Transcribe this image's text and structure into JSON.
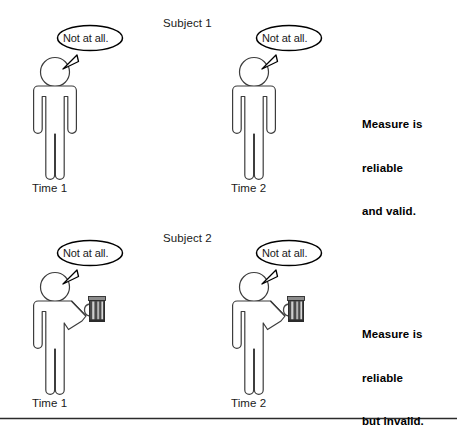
{
  "page": {
    "width": 457,
    "height": 426,
    "background_color": "#ffffff",
    "line_color": "#3d3d3d",
    "text_color": "#1a1a1a",
    "footer_rule": true
  },
  "panels": [
    {
      "id": "subject-1",
      "title": "Subject 1",
      "verdict": [
        "Measure is",
        "reliable",
        "and valid."
      ],
      "figures": [
        {
          "id": "s1-t1",
          "time_label": "Time 1",
          "bubble_text": "Not at all.",
          "holds_mug": false
        },
        {
          "id": "s1-t2",
          "time_label": "Time 2",
          "bubble_text": "Not at all.",
          "holds_mug": false
        }
      ]
    },
    {
      "id": "subject-2",
      "title": "Subject 2",
      "verdict": [
        "Measure is",
        "reliable",
        "but invalid."
      ],
      "figures": [
        {
          "id": "s2-t1",
          "time_label": "Time 1",
          "bubble_text": "Not at all.",
          "holds_mug": true
        },
        {
          "id": "s2-t2",
          "time_label": "Time 2",
          "bubble_text": "Not at all.",
          "holds_mug": true
        }
      ]
    }
  ],
  "icons": {
    "person": "person-pictogram-icon",
    "speech": "speech-bubble-icon",
    "mug": "beer-mug-icon"
  }
}
